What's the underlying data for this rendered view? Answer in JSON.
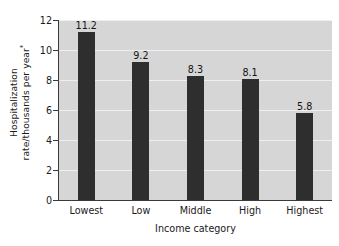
{
  "chart_data": {
    "type": "bar",
    "title": "",
    "subtitle": "",
    "categories": [
      "Lowest",
      "Low",
      "Middle",
      "High",
      "Highest"
    ],
    "values": [
      11.2,
      9.2,
      8.3,
      8.1,
      5.8
    ],
    "value_labels": [
      "11.2",
      "9.2",
      "8.3",
      "8.1",
      "5.8"
    ],
    "xlabel": "Income category",
    "ylabel_line1": "Hospitalization",
    "ylabel_line2": "rate/thousands per year",
    "ylabel_footnote_marker": "*",
    "ylim": [
      0,
      12
    ],
    "ytick_values": [
      0,
      2,
      4,
      6,
      8,
      10,
      12
    ],
    "ytick_labels": [
      "0",
      "2",
      "4",
      "6",
      "8",
      "10",
      "12"
    ],
    "grid": "horizontal",
    "legend": "none",
    "colors": {
      "bar": "#2e2e2e",
      "plot_background": "#d6d6d6",
      "figure_background": "#ffffff",
      "gridline": "#efefef",
      "axis": "#3a3a3a",
      "text": "#1a1a1a"
    }
  }
}
